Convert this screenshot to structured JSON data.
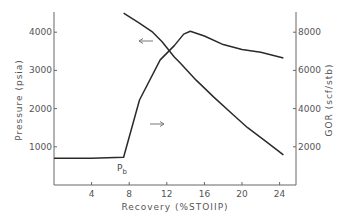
{
  "chart_data": {
    "type": "line",
    "title": "",
    "xlabel": "Recovery (%STOIIP)",
    "ylabel": "Pressure (psia)",
    "y2label": "GOR (scf/stb)",
    "xlim": [
      0,
      25.5
    ],
    "ylim": [
      0,
      4700
    ],
    "y2lim": [
      0,
      9400
    ],
    "x_ticks": [
      4,
      8,
      12,
      16,
      20,
      24
    ],
    "y_ticks": [
      1000,
      2000,
      3000,
      4000
    ],
    "y2_ticks": [
      2000,
      4000,
      6000,
      8000
    ],
    "grid": false,
    "legend": "none (arrows indicate axis for each curve)",
    "series": [
      {
        "name": "Pressure",
        "axis": "left",
        "x": [
          7.4,
          9.0,
          10.5,
          11.5,
          12.8,
          13.4,
          15.1,
          17.0,
          19.0,
          20.6,
          22.5,
          24.4
        ],
        "values": [
          4500,
          4250,
          4000,
          3750,
          3350,
          3200,
          2750,
          2300,
          1850,
          1500,
          1150,
          790
        ]
      },
      {
        "name": "GOR",
        "axis": "right",
        "x": [
          0,
          4,
          7.4,
          9.1,
          11.3,
          12.8,
          13.8,
          14.5,
          16,
          18,
          20,
          22,
          24.4
        ],
        "values": [
          1400,
          1400,
          1450,
          4450,
          6550,
          7300,
          7900,
          8050,
          7800,
          7350,
          7100,
          6950,
          6650
        ]
      }
    ],
    "annotations": [
      {
        "text": "P",
        "sub": "b",
        "x": 7.4,
        "note": "bubble point"
      },
      {
        "text": "←",
        "points_to": "left axis (Pressure curve)"
      },
      {
        "text": "→",
        "points_to": "right axis (GOR curve)"
      }
    ]
  },
  "labels": {
    "x_axis_title": "Recovery (%STOIIP)",
    "y_axis_title": "Pressure (psia)",
    "y2_axis_title": "GOR (scf/stb)",
    "pb_main": "P",
    "pb_sub": "b"
  }
}
